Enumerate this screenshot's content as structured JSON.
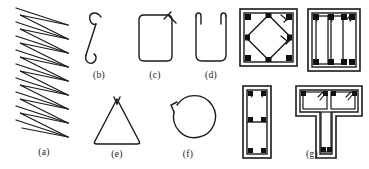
{
  "figure": {
    "stroke_color": "#1a1a1a",
    "fill_color": "#ffffff",
    "bar_color": "#111111",
    "background": "#ffffff",
    "panels": [
      {
        "key": "a",
        "label": "(a)",
        "name": "continuous-spiral-zigzag-stirrup",
        "shape": "zigzag",
        "zigzag_rows": 9,
        "label_x": 44,
        "label_y": 155
      },
      {
        "key": "b",
        "label": "(b)",
        "name": "single-leg-tie-bar",
        "shape": "single-leg-hook",
        "label_x": 99,
        "label_y": 78
      },
      {
        "key": "c",
        "label": "(c)",
        "name": "closed-rectangular-stirrup",
        "shape": "rectangle-closed",
        "label_x": 155,
        "label_y": 78
      },
      {
        "key": "d",
        "label": "(d)",
        "name": "open-u-shaped-stirrup",
        "shape": "u-open",
        "label_x": 211,
        "label_y": 78
      },
      {
        "key": "e",
        "label": "(e)",
        "name": "triangular-stirrup",
        "shape": "triangle",
        "label_x": 117,
        "label_y": 157
      },
      {
        "key": "f",
        "label": "(f)",
        "name": "circular-spiral-stirrup",
        "shape": "circle",
        "label_x": 188,
        "label_y": 157
      },
      {
        "key": "g",
        "label": "(g)",
        "name": "composite-column-section-stirrups",
        "shape": "section-group",
        "label_x": 312,
        "label_y": 157,
        "sections": [
          {
            "name": "square-section-with-diamond-tie",
            "outer": "square",
            "inner": "diamond",
            "corner_bars": 4,
            "mid_bars": 4
          },
          {
            "name": "rectangular-section-with-two-inner-ties",
            "outer": "rectangle",
            "inner": "two-vertical-ties",
            "top_bars": 3,
            "bottom_bars": 3
          },
          {
            "name": "narrow-rectangular-section-two-cells",
            "outer": "tall-rectangle",
            "inner": "two-stacked-cells",
            "bars": 6
          },
          {
            "name": "t-shaped-section-with-flange-and-web-ties",
            "outer": "tee",
            "inner": "flange-ties-and-web-tie",
            "flange_bars": 4,
            "web_bars": 2
          }
        ]
      }
    ]
  }
}
